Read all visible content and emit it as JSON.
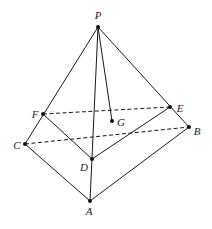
{
  "diagram": {
    "type": "pyramid-geometry",
    "points": [
      {
        "id": "P",
        "x": 98,
        "y": 27,
        "lx": 98,
        "ly": 19,
        "anchor": "middle"
      },
      {
        "id": "F",
        "x": 43,
        "y": 114,
        "lx": 35,
        "ly": 118,
        "anchor": "middle"
      },
      {
        "id": "E",
        "x": 170,
        "y": 107,
        "lx": 180,
        "ly": 112,
        "anchor": "middle"
      },
      {
        "id": "G",
        "x": 112,
        "y": 121,
        "lx": 121,
        "ly": 126,
        "anchor": "middle"
      },
      {
        "id": "B",
        "x": 189,
        "y": 127,
        "lx": 197,
        "ly": 135,
        "anchor": "middle"
      },
      {
        "id": "C",
        "x": 25,
        "y": 144,
        "lx": 17,
        "ly": 149,
        "anchor": "middle"
      },
      {
        "id": "D",
        "x": 92,
        "y": 159,
        "lx": 84,
        "ly": 171,
        "anchor": "middle"
      },
      {
        "id": "A",
        "x": 90,
        "y": 201,
        "lx": 89,
        "ly": 215,
        "anchor": "middle"
      }
    ],
    "solid_edges": [
      [
        "P",
        "C"
      ],
      [
        "P",
        "A"
      ],
      [
        "P",
        "B"
      ],
      [
        "P",
        "G"
      ],
      [
        "C",
        "A"
      ],
      [
        "A",
        "B"
      ],
      [
        "F",
        "D"
      ],
      [
        "D",
        "E"
      ]
    ],
    "dashed_edges": [
      [
        "F",
        "E"
      ],
      [
        "C",
        "B"
      ]
    ],
    "labels": {
      "P": "P",
      "F": "F",
      "E": "E",
      "G": "G",
      "B": "B",
      "C": "C",
      "D": "D",
      "A": "A"
    }
  }
}
